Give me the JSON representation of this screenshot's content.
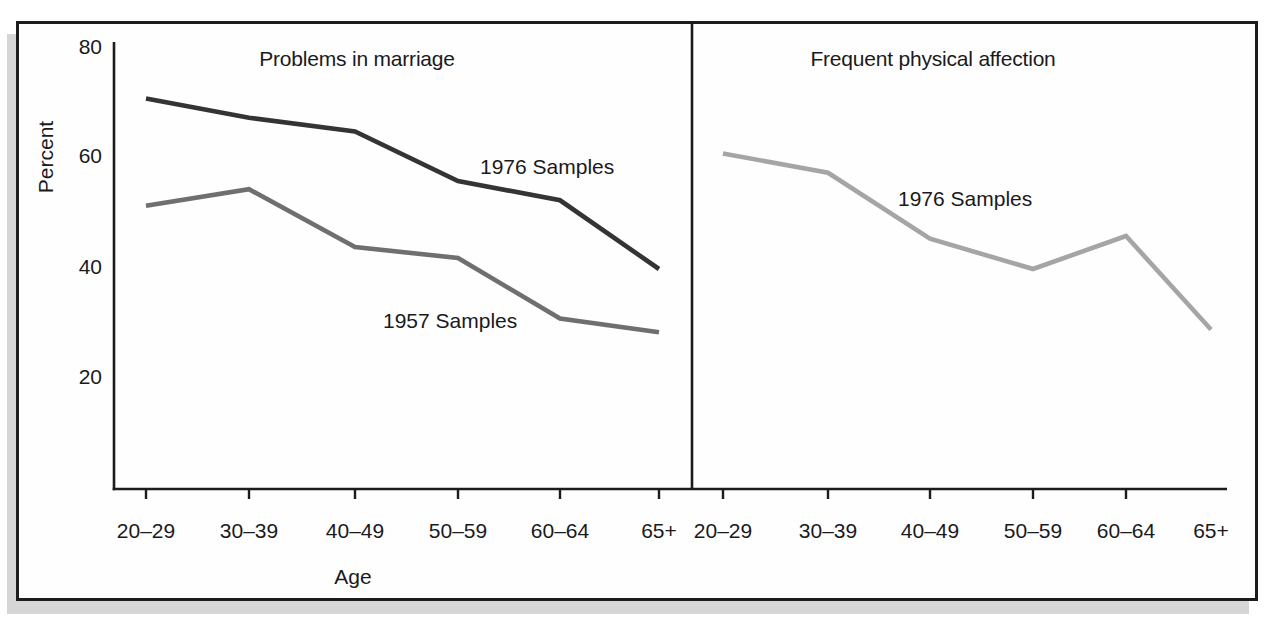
{
  "figure": {
    "y_tick_labels": [
      "80",
      "60",
      "40",
      "20"
    ]
  },
  "chart_data": [
    {
      "type": "line",
      "title": "Problems in marriage",
      "categories": [
        "20–29",
        "30–39",
        "40–49",
        "50–59",
        "60–64",
        "65+"
      ],
      "xlabel": "Age",
      "ylabel": "Percent",
      "ylim": [
        0,
        80
      ],
      "yticks": [
        20,
        40,
        60,
        80
      ],
      "grid": false,
      "legend_position": "inline-labels",
      "series": [
        {
          "name": "1976 Samples",
          "values": [
            71,
            67.5,
            65,
            56,
            52.5,
            40
          ],
          "color": "#343436"
        },
        {
          "name": "1957 Samples",
          "values": [
            51.5,
            54.5,
            44,
            42,
            31,
            28.5
          ],
          "color": "#6f6f72"
        }
      ]
    },
    {
      "type": "line",
      "title": "Frequent physical affection",
      "categories": [
        "20–29",
        "30–39",
        "40–49",
        "50–59",
        "60–64",
        "65+"
      ],
      "xlabel": "",
      "ylabel": "Percent",
      "ylim": [
        0,
        80
      ],
      "yticks": [
        20,
        40,
        60,
        80
      ],
      "grid": false,
      "legend_position": "inline-labels",
      "series": [
        {
          "name": "1976 Samples",
          "values": [
            61,
            57.5,
            45.5,
            40,
            46,
            29
          ],
          "color": "#a5a5a7"
        }
      ]
    }
  ],
  "colors": {
    "axis": "#1c1c1e",
    "text": "#1a1a1c",
    "frame_border": "#1c1c1e",
    "frame_shadow": "#d6d6d6",
    "background": "#ffffff",
    "series_problems_1976": "#343436",
    "series_problems_1957": "#6f6f72",
    "series_affection_1976": "#a5a5a7"
  }
}
